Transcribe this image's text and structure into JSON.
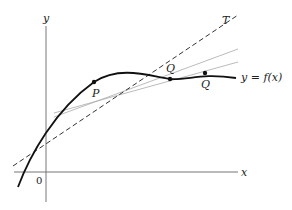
{
  "diagram": {
    "type": "tangent-secant-limit",
    "axes": {
      "x_label": "x",
      "y_label": "y",
      "origin_label": "0"
    },
    "curve": {
      "label": "y = f(x)",
      "color": "#111111"
    },
    "tangent": {
      "label": "T",
      "style": "dashed",
      "color": "#222222"
    },
    "secants": [
      {
        "through": [
          "P",
          "Q"
        ],
        "color": "#999999"
      },
      {
        "through": [
          "P",
          "Q"
        ],
        "color": "#999999"
      }
    ],
    "points": [
      {
        "label": "P"
      },
      {
        "label": "Q"
      },
      {
        "label": "Q"
      }
    ]
  }
}
